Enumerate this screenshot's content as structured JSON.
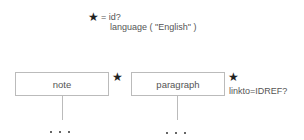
{
  "legend": {
    "symbol_icon": "star-icon",
    "line1": "= id?",
    "line2": "language ( \"English\" )"
  },
  "nodes": [
    {
      "label": "note",
      "marker_icon": "star-icon",
      "attribute": "",
      "children": "• • •"
    },
    {
      "label": "paragraph",
      "marker_icon": "star-icon",
      "attribute": "linkto=IDREF?",
      "children": "• • •"
    }
  ],
  "colors": {
    "box_border": "#bbbbbb",
    "text": "#555555",
    "star": "#222222"
  }
}
